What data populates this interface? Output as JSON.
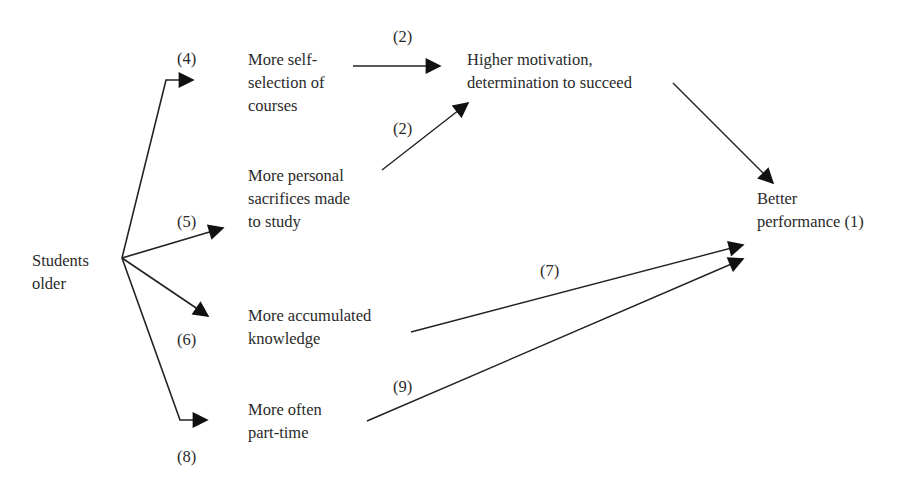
{
  "diagram": {
    "type": "causal-flow",
    "nodes": {
      "students_older": {
        "lines": [
          "Students",
          "older"
        ]
      },
      "self_selection": {
        "lines": [
          "More self-",
          "selection of",
          "courses"
        ]
      },
      "sacrifices": {
        "lines": [
          "More personal",
          "sacrifices made",
          "to study"
        ]
      },
      "knowledge": {
        "lines": [
          "More accumulated",
          "knowledge"
        ]
      },
      "part_time": {
        "lines": [
          "More often",
          "part-time"
        ]
      },
      "motivation": {
        "lines": [
          "Higher motivation,",
          "determination to succeed"
        ]
      },
      "performance": {
        "lines": [
          "Better",
          "performance (1)"
        ]
      }
    },
    "edge_labels": {
      "to_self_selection": "(4)",
      "to_sacrifices": "(5)",
      "to_knowledge": "(6)",
      "to_part_time": "(8)",
      "self_selection_to_motivation": "(2)",
      "sacrifices_to_motivation": "(2)",
      "knowledge_to_performance": "(7)",
      "part_time_to_performance": "(9)"
    },
    "edges": [
      {
        "from": "students_older",
        "to": "self_selection",
        "label": "(4)"
      },
      {
        "from": "students_older",
        "to": "sacrifices",
        "label": "(5)"
      },
      {
        "from": "students_older",
        "to": "knowledge",
        "label": "(6)"
      },
      {
        "from": "students_older",
        "to": "part_time",
        "label": "(8)"
      },
      {
        "from": "self_selection",
        "to": "motivation",
        "label": "(2)"
      },
      {
        "from": "sacrifices",
        "to": "motivation",
        "label": "(2)"
      },
      {
        "from": "motivation",
        "to": "performance",
        "label": ""
      },
      {
        "from": "knowledge",
        "to": "performance",
        "label": "(7)"
      },
      {
        "from": "part_time",
        "to": "performance",
        "label": "(9)"
      }
    ],
    "colors": {
      "line": "#222222",
      "text": "#2a2a2a",
      "background": "#ffffff"
    }
  }
}
